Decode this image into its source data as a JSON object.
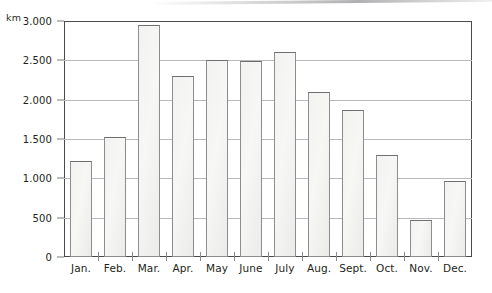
{
  "chart_data": {
    "type": "bar",
    "title": "",
    "subtitle": "",
    "xlabel": "",
    "ylabel": "km",
    "unit_label": "km",
    "categories": [
      "Jan.",
      "Feb.",
      "Mar.",
      "Apr.",
      "May",
      "June",
      "July",
      "Aug.",
      "Sept.",
      "Oct.",
      "Nov.",
      "Dec."
    ],
    "values": [
      1220,
      1530,
      2950,
      2300,
      2500,
      2490,
      2600,
      2100,
      1870,
      1300,
      470,
      970
    ],
    "ylim": [
      0,
      3000
    ],
    "ytick_values": [
      0,
      500,
      1000,
      1500,
      2000,
      2500,
      3000
    ],
    "ytick_labels": [
      "0",
      "500",
      "1.000",
      "1.500",
      "2.000",
      "2.500",
      "3.000"
    ],
    "grid": true,
    "grid_axis": "y",
    "legend": false,
    "legend_entries": [],
    "annotations": [],
    "colors": {
      "bar_fill": "#f3f3f1",
      "bar_stroke": "#8d8d90",
      "gridline": "#b9b9bb",
      "frame": "#4a4a4c",
      "text": "#231f20",
      "background": "#ffffff"
    }
  }
}
